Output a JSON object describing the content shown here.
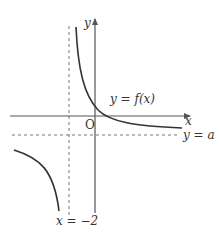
{
  "figure": {
    "type": "function-graph"
  },
  "labels": {
    "x_axis": "x",
    "y_axis": "y",
    "origin": "O",
    "curve": "y = f(x)",
    "horizontal_asymptote": "y = a",
    "vertical_asymptote": "x = −2"
  },
  "asymptotes": {
    "vertical": {
      "x": -2,
      "style": "dashed"
    },
    "horizontal": {
      "y": "a",
      "style": "dashed"
    }
  },
  "colors": {
    "axis": "#555555",
    "curve": "#333333",
    "dashed": "#777777",
    "text": "#333333"
  }
}
